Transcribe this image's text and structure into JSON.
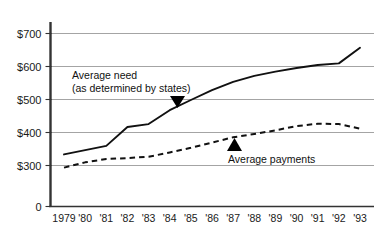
{
  "chart_data": {
    "type": "line",
    "title": "",
    "xlabel": "",
    "ylabel": "",
    "grid": true,
    "legend_position": "inline-annotations",
    "categories": [
      "1979",
      "'80",
      "'81",
      "'82",
      "'83",
      "'84",
      "'85",
      "'86",
      "'87",
      "'88",
      "'89",
      "'90",
      "'91",
      "'92",
      "'93"
    ],
    "x_tick_labels": [
      "1979",
      "'80",
      "'81",
      "'82",
      "'83",
      "'84",
      "'85",
      "'86",
      "'87",
      "'88",
      "'89",
      "'90",
      "'91",
      "'92",
      "'93"
    ],
    "y_tick_labels": [
      "$700",
      "$600",
      "$500",
      "$400",
      "$300",
      "0"
    ],
    "y_tick_values": [
      700,
      600,
      500,
      400,
      300,
      0
    ],
    "ylim": [
      300,
      700
    ],
    "y_axis_break": true,
    "y_axis_break_note": "0 baseline shown below $300 with scale break",
    "series": [
      {
        "name": "Average need (as determined by states)",
        "style": "solid",
        "values": [
          332,
          345,
          358,
          415,
          424,
          466,
          497,
          527,
          552,
          570,
          583,
          594,
          603,
          608,
          655
        ]
      },
      {
        "name": "Average payments",
        "style": "dashed",
        "values": [
          292,
          308,
          318,
          321,
          325,
          338,
          352,
          368,
          384,
          394,
          405,
          418,
          425,
          424,
          410
        ]
      }
    ],
    "annotations": [
      {
        "name": "average-need",
        "lines": [
          "Average need",
          "(as determined by states)"
        ],
        "marker": "triangle-down",
        "points_to_series": "Average need (as determined by states)",
        "points_to_year": "'84"
      },
      {
        "name": "average-payments",
        "lines": [
          "Average payments"
        ],
        "marker": "triangle-up",
        "points_to_series": "Average payments",
        "points_to_year": "'87"
      }
    ],
    "colors": {
      "background": "#ffffff",
      "ink": "#111111",
      "gridline": "#9a9a9a",
      "axis": "#333333"
    }
  }
}
